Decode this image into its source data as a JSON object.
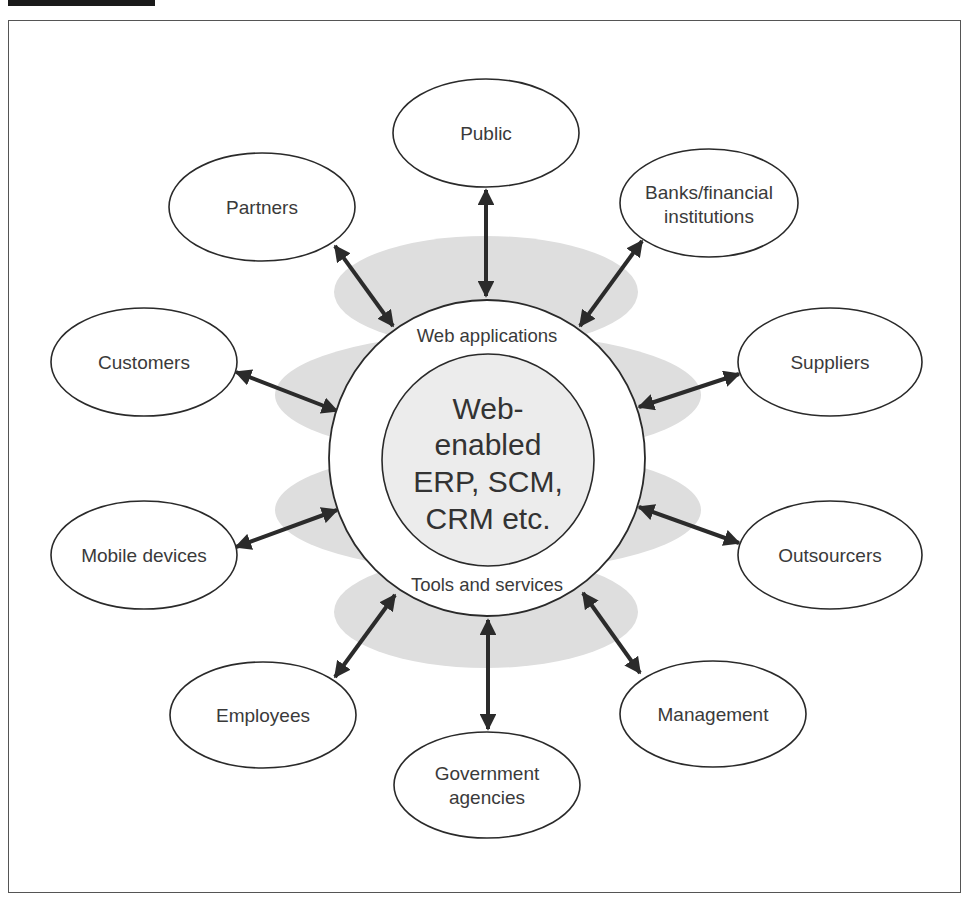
{
  "diagram": {
    "type": "hub-and-spoke",
    "colors": {
      "cloud": "#dedede",
      "stroke": "#2a2a2a",
      "text": "#3a3a3a",
      "core_fill": "#ececec"
    },
    "core": {
      "lines": [
        "Web-",
        "enabled",
        "ERP, SCM,",
        "CRM etc."
      ]
    },
    "ring": {
      "top_label": "Web applications",
      "bottom_label": "Tools and services"
    },
    "nodes": [
      {
        "id": "public",
        "lines": [
          "Public"
        ]
      },
      {
        "id": "partners",
        "lines": [
          "Partners"
        ]
      },
      {
        "id": "banks",
        "lines": [
          "Banks/financial",
          "institutions"
        ]
      },
      {
        "id": "customers",
        "lines": [
          "Customers"
        ]
      },
      {
        "id": "suppliers",
        "lines": [
          "Suppliers"
        ]
      },
      {
        "id": "mobile-devices",
        "lines": [
          "Mobile devices"
        ]
      },
      {
        "id": "outsourcers",
        "lines": [
          "Outsourcers"
        ]
      },
      {
        "id": "employees",
        "lines": [
          "Employees"
        ]
      },
      {
        "id": "government-agencies",
        "lines": [
          "Government",
          "agencies"
        ]
      },
      {
        "id": "management",
        "lines": [
          "Management"
        ]
      }
    ],
    "connections": [
      {
        "from": "core",
        "to": "public",
        "bidirectional": true
      },
      {
        "from": "core",
        "to": "partners",
        "bidirectional": true
      },
      {
        "from": "core",
        "to": "banks",
        "bidirectional": true
      },
      {
        "from": "core",
        "to": "customers",
        "bidirectional": true
      },
      {
        "from": "core",
        "to": "suppliers",
        "bidirectional": true
      },
      {
        "from": "core",
        "to": "mobile-devices",
        "bidirectional": true
      },
      {
        "from": "core",
        "to": "outsourcers",
        "bidirectional": true
      },
      {
        "from": "core",
        "to": "employees",
        "bidirectional": true
      },
      {
        "from": "core",
        "to": "government-agencies",
        "bidirectional": true
      },
      {
        "from": "core",
        "to": "management",
        "bidirectional": true
      }
    ]
  }
}
